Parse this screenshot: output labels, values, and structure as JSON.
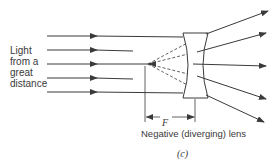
{
  "figure": {
    "left_label": "Light from a great distance",
    "lens_caption": "Negative (diverging) lens",
    "focal_label": "F",
    "panel_label": "(c)"
  },
  "colors": {
    "line": "#3a3a3a",
    "background": "#ffffff"
  },
  "rays": {
    "incoming_y": [
      36,
      50,
      64,
      78,
      92
    ],
    "focal_point": [
      148,
      64
    ],
    "lens_x_range": [
      182,
      208
    ],
    "lens_y_range": [
      33,
      98
    ]
  }
}
